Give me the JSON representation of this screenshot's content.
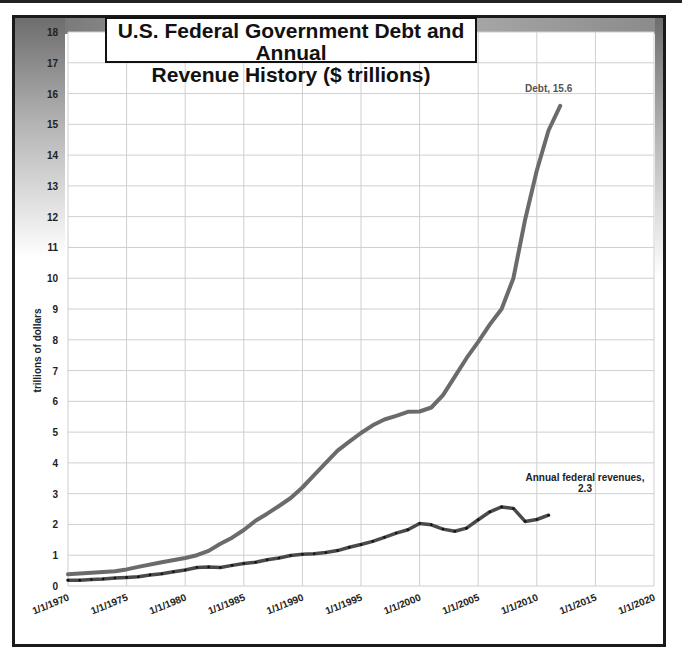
{
  "chart_data": {
    "type": "line",
    "title": "U.S. Federal Government Debt and Annual Revenue History ($ trillions)",
    "title_lines": [
      "U.S. Federal Government Debt and Annual",
      "Revenue History ($ trillions)"
    ],
    "xlabel": "",
    "ylabel": "trillions of dollars",
    "ylim": [
      0,
      18
    ],
    "xlim": [
      "1/1/1970",
      "1/1/2020"
    ],
    "grid": true,
    "legend": "none (inline data labels)",
    "x_ticks": [
      "1/1/1970",
      "1/1/1975",
      "1/1/1980",
      "1/1/1985",
      "1/1/1990",
      "1/1/1995",
      "1/1/2000",
      "1/1/2005",
      "1/1/2010",
      "1/1/2015",
      "1/1/2020"
    ],
    "y_ticks": [
      0,
      1,
      2,
      3,
      4,
      5,
      6,
      7,
      8,
      9,
      10,
      11,
      12,
      13,
      14,
      15,
      16,
      17,
      18
    ],
    "series": [
      {
        "name": "Debt",
        "color": "#6b6b6b",
        "x": [
          1970,
          1972,
          1974,
          1975,
          1976,
          1978,
          1980,
          1981,
          1982,
          1983,
          1984,
          1985,
          1986,
          1987,
          1988,
          1989,
          1990,
          1991,
          1992,
          1993,
          1994,
          1995,
          1996,
          1997,
          1998,
          1999,
          2000,
          2001,
          2002,
          2003,
          2004,
          2005,
          2006,
          2007,
          2008,
          2009,
          2010,
          2011,
          2012
        ],
        "values": [
          0.38,
          0.43,
          0.48,
          0.54,
          0.62,
          0.77,
          0.91,
          1.0,
          1.14,
          1.37,
          1.57,
          1.82,
          2.12,
          2.35,
          2.6,
          2.86,
          3.2,
          3.6,
          4.0,
          4.4,
          4.69,
          4.97,
          5.22,
          5.41,
          5.53,
          5.66,
          5.67,
          5.8,
          6.2,
          6.8,
          7.4,
          7.93,
          8.5,
          9.0,
          10.0,
          11.9,
          13.5,
          14.8,
          15.6
        ],
        "end_label": "Debt, 15.6"
      },
      {
        "name": "Annual federal revenues",
        "color": "#4a4a4a",
        "marker": "small dots",
        "x": [
          1970,
          1971,
          1972,
          1973,
          1974,
          1975,
          1976,
          1977,
          1978,
          1979,
          1980,
          1981,
          1982,
          1983,
          1984,
          1985,
          1986,
          1987,
          1988,
          1989,
          1990,
          1991,
          1992,
          1993,
          1994,
          1995,
          1996,
          1997,
          1998,
          1999,
          2000,
          2001,
          2002,
          2003,
          2004,
          2005,
          2006,
          2007,
          2008,
          2009,
          2010,
          2011
        ],
        "values": [
          0.19,
          0.19,
          0.21,
          0.23,
          0.26,
          0.28,
          0.3,
          0.36,
          0.4,
          0.46,
          0.52,
          0.6,
          0.62,
          0.6,
          0.67,
          0.73,
          0.77,
          0.85,
          0.91,
          0.99,
          1.03,
          1.05,
          1.09,
          1.15,
          1.26,
          1.35,
          1.45,
          1.58,
          1.72,
          1.83,
          2.03,
          1.99,
          1.85,
          1.78,
          1.88,
          2.15,
          2.41,
          2.57,
          2.52,
          2.1,
          2.16,
          2.3
        ],
        "end_label": "Annual federal revenues, 2.3"
      }
    ]
  },
  "annotations": {
    "debt_label": "Debt, 15.6",
    "revenue_label_line1": "Annual federal revenues,",
    "revenue_label_line2": "2.3"
  }
}
